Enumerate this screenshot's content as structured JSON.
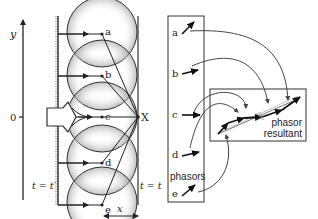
{
  "axis": {
    "y_label": "y",
    "origin_label": "0"
  },
  "wavefront": {
    "left_label": "t = t′",
    "right_label": "t = t",
    "distance_label": "x",
    "point_label": "X",
    "points": [
      "a",
      "b",
      "c",
      "d",
      "e"
    ]
  },
  "phasors": {
    "box_label": "phasors",
    "items": [
      {
        "label": "a",
        "angle": -45
      },
      {
        "label": "b",
        "angle": -15
      },
      {
        "label": "c",
        "angle": 0
      },
      {
        "label": "d",
        "angle": -15
      },
      {
        "label": "e",
        "angle": -45
      }
    ]
  },
  "resultant": {
    "label_line1": "phasor",
    "label_line2": "resultant"
  },
  "colors": {
    "stroke": "#222222",
    "shading": "#9a9a9a",
    "box": "#333333",
    "curve": "#444444"
  }
}
